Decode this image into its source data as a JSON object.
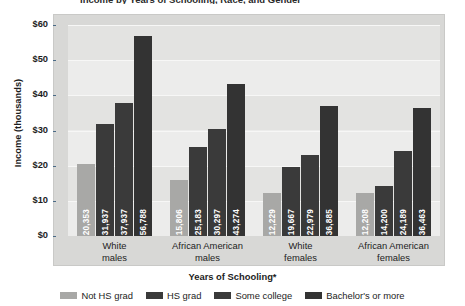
{
  "chart_data": {
    "type": "bar",
    "title": "Income by Years of Schooling, Race, and Gender",
    "xlabel": "Years of Schooling*",
    "ylabel": "Income (thousands)",
    "categories": [
      "White males",
      "African American males",
      "White females",
      "African American females"
    ],
    "category_lines": [
      [
        "White",
        "males"
      ],
      [
        "African American",
        "males"
      ],
      [
        "White",
        "females"
      ],
      [
        "African American",
        "females"
      ]
    ],
    "series": [
      {
        "name": "Not HS grad",
        "color": "#a8a8a6",
        "values": [
          20353,
          15806,
          12229,
          12208
        ],
        "labels": [
          "20,353",
          "15,806",
          "12,229",
          "12,208"
        ]
      },
      {
        "name": "HS grad",
        "color": "#3a3a3a",
        "values": [
          31937,
          25183,
          19667,
          14200
        ],
        "labels": [
          "31,937",
          "25,183",
          "19,667",
          "14,200"
        ]
      },
      {
        "name": "Some college",
        "color": "#3a3a3a",
        "values": [
          37937,
          30297,
          22979,
          24189
        ],
        "labels": [
          "37,937",
          "30,297",
          "22,979",
          "24,189"
        ]
      },
      {
        "name": "Bachelor's or more",
        "color": "#333333",
        "values": [
          56788,
          43274,
          36885,
          36463
        ],
        "labels": [
          "56,788",
          "43,274",
          "36,885",
          "36,463"
        ]
      }
    ],
    "ylim": [
      0,
      60000
    ],
    "ytick_values": [
      0,
      10000,
      20000,
      30000,
      40000,
      50000,
      60000
    ],
    "ytick_labels": [
      "$0",
      "$10",
      "$20",
      "$30",
      "$40",
      "$50",
      "$60"
    ],
    "grid": true,
    "legend_position": "bottom",
    "footnote_marker": "*"
  },
  "legend": {
    "items": [
      {
        "label": "Not HS grad",
        "color": "#a8a8a6"
      },
      {
        "label": "HS grad",
        "color": "#3a3a3a"
      },
      {
        "label": "Some college",
        "color": "#3a3a3a"
      },
      {
        "label": "Bachelor's or more",
        "color": "#333333"
      }
    ]
  }
}
